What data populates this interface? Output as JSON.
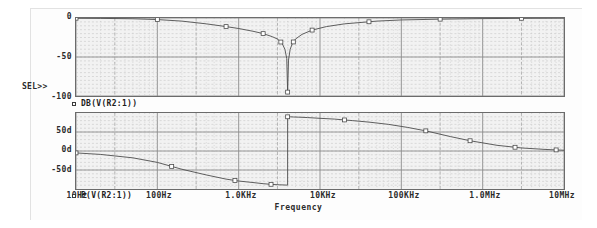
{
  "app": {
    "title": "PSpice Probe - Frequency Response"
  },
  "axis": {
    "x_title": "Frequency",
    "x_ticks": [
      "10Hz",
      "100Hz",
      "1.0KHz",
      "10KHz",
      "100KHz",
      "1.0MHz",
      "10MHz"
    ],
    "y_ticks_magnitude": [
      "0",
      "-50",
      "-100"
    ],
    "y_ticks_phase": [
      "50d",
      "0d",
      "-50d"
    ]
  },
  "markers": {
    "selected_panel_indicator": "SEL>>"
  },
  "legends": {
    "magnitude": "DB(V(R2:1))",
    "phase": "P(V(R2:1))",
    "swatch_icon": "square-marker-icon"
  },
  "colors": {
    "plot_background": "#f2f2f2",
    "plot_border": "#6b6b6b",
    "grid_minor": "#b9b9b9",
    "grid_major": "#8a8a8a",
    "trace": "#4a4a4a",
    "text": "#2b2b2b",
    "page_background": "#ffffff"
  },
  "chart_data": [
    {
      "type": "line",
      "id": "magnitude-plot",
      "title": "",
      "xlabel": "Frequency",
      "ylabel": "",
      "xscale": "log",
      "xlim": [
        10,
        10000000
      ],
      "ylim": [
        -100,
        0
      ],
      "grid": true,
      "legend": "DB(V(R2:1))",
      "ytick_values": [
        0,
        -50,
        -100
      ],
      "ytick_labels": [
        "0",
        "-50",
        "-100"
      ],
      "xtick_values": [
        10,
        100,
        1000,
        10000,
        100000,
        1000000,
        10000000
      ],
      "xtick_labels": [
        "10Hz",
        "100Hz",
        "1.0KHz",
        "10KHz",
        "100KHz",
        "1.0MHz",
        "10MHz"
      ],
      "series": [
        {
          "name": "DB(V(R2:1))",
          "units": "dB",
          "x": [
            10,
            20,
            50,
            100,
            200,
            400,
            700,
            1000,
            1500,
            2000,
            2600,
            3000,
            3400,
            3700,
            3900,
            4000,
            4100,
            4300,
            4600,
            5000,
            6000,
            8000,
            12000,
            20000,
            50000,
            100000,
            300000,
            1000000,
            3000000,
            10000000
          ],
          "y": [
            -0.3,
            -0.5,
            -1.0,
            -2.0,
            -4.0,
            -7.5,
            -11.0,
            -13.5,
            -17.0,
            -20.0,
            -24.0,
            -27.0,
            -32.0,
            -40.0,
            -52.0,
            -95.0,
            -54.0,
            -40.0,
            -32.0,
            -27.0,
            -21.0,
            -15.5,
            -11.0,
            -7.5,
            -4.0,
            -2.5,
            -1.5,
            -0.8,
            -0.4,
            -0.2
          ],
          "markers_x": [
            10,
            100,
            700,
            2000,
            3300,
            4000,
            4700,
            8000,
            40000,
            300000,
            3000000
          ],
          "marker_style": "open-square"
        }
      ]
    },
    {
      "type": "line",
      "id": "phase-plot",
      "title": "",
      "xlabel": "Frequency",
      "ylabel": "",
      "xscale": "log",
      "xlim": [
        10,
        10000000
      ],
      "ylim": [
        -100,
        100
      ],
      "grid": true,
      "legend": "P(V(R2:1))",
      "ytick_values": [
        50,
        0,
        -50
      ],
      "ytick_labels": [
        "50d",
        "0d",
        "-50d"
      ],
      "xtick_values": [
        10,
        100,
        1000,
        10000,
        100000,
        1000000,
        10000000
      ],
      "xtick_labels": [
        "10Hz",
        "100Hz",
        "1.0KHz",
        "10KHz",
        "100KHz",
        "1.0MHz",
        "10MHz"
      ],
      "series": [
        {
          "name": "P(V(R2:1))",
          "units": "degrees",
          "x": [
            10,
            20,
            50,
            100,
            200,
            400,
            700,
            1000,
            1500,
            2000,
            2600,
            3200,
            3700,
            3950,
            3999,
            4000,
            4001,
            4050,
            4300,
            4700,
            5500,
            7000,
            10000,
            15000,
            25000,
            40000,
            70000,
            120000,
            200000,
            400000,
            700000,
            1500000,
            3000000,
            6000000,
            10000000
          ],
          "y": [
            -5,
            -9,
            -18,
            -30,
            -48,
            -63,
            -74,
            -79,
            -83,
            -86,
            -88,
            -89,
            -89.5,
            -89.8,
            -90,
            90,
            90,
            90,
            90,
            89.5,
            89,
            88,
            86,
            84,
            80,
            76,
            70,
            62,
            53,
            38,
            27,
            15,
            8,
            4,
            2
          ],
          "markers_x": [
            10,
            150,
            900,
            2500,
            4000,
            20000,
            200000,
            700000,
            2500000,
            8000000
          ],
          "marker_style": "open-square",
          "note": "phase wraps from -90d to +90d at the notch frequency"
        }
      ]
    }
  ]
}
